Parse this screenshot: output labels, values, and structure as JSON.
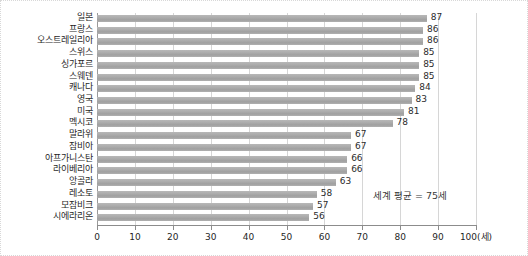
{
  "chart_data": {
    "type": "bar",
    "orientation": "horizontal",
    "title": "",
    "xlabel": "100(세)",
    "ylabel": "",
    "xlim": [
      0,
      100
    ],
    "grid": true,
    "legend": null,
    "categories": [
      "일본",
      "프랑스",
      "오스트레일리아",
      "스위스",
      "싱가포르",
      "스웨덴",
      "캐나다",
      "영국",
      "미국",
      "멕시코",
      "말라위",
      "잠비아",
      "아프가니스탄",
      "라이베리아",
      "앙골라",
      "레소토",
      "모잠비크",
      "시에라리온"
    ],
    "values": [
      87,
      86,
      86,
      85,
      85,
      85,
      84,
      83,
      81,
      78,
      67,
      67,
      66,
      66,
      63,
      58,
      57,
      56
    ],
    "value_labels": [
      "87",
      "86",
      "86",
      "85",
      "85",
      "85",
      "84",
      "83",
      "81",
      "78",
      "67",
      "67",
      "66",
      "66",
      "63",
      "58",
      "57",
      "56"
    ],
    "xticks": [
      0,
      10,
      20,
      30,
      40,
      50,
      60,
      70,
      80,
      90,
      100
    ],
    "xtick_labels": [
      "0",
      "10",
      "20",
      "30",
      "40",
      "50",
      "60",
      "70",
      "80",
      "90",
      "100(세)"
    ],
    "annotations": [
      {
        "text": "세계 평균 = 75세",
        "x": 75
      }
    ],
    "colors": {
      "bar": "#adadad",
      "grid": "#d6d6d6",
      "axis": "#8c8c8c",
      "text": "#1f1f1f"
    }
  }
}
